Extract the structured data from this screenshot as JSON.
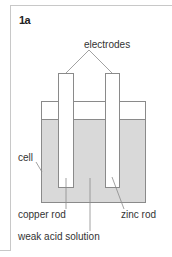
{
  "figure": {
    "label": "1a"
  },
  "labels": {
    "electrodes": "electrodes",
    "cell": "cell",
    "copper_rod": "copper rod",
    "zinc_rod": "zinc rod",
    "weak_acid_solution": "weak acid solution"
  },
  "colors": {
    "solution_fill": "#d9d9d9",
    "outline": "#8a8a8a",
    "frame": "#c8c8c8",
    "text": "#333333"
  }
}
